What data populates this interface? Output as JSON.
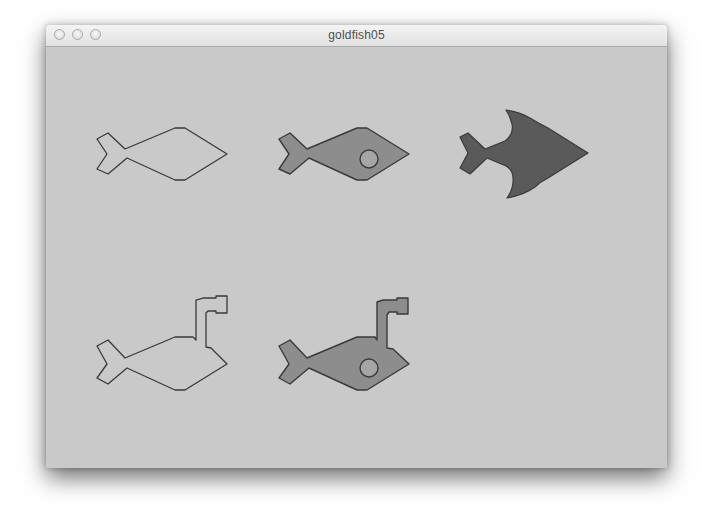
{
  "window": {
    "title": "goldfish05",
    "buttons": [
      "close",
      "minimize",
      "zoom"
    ]
  },
  "colors": {
    "background": "#c9c9c9",
    "outline": "#3a3a3a",
    "fish_fill_medium": "#8d8d8d",
    "shark_fill": "#5a5a5a",
    "eye_fill": "#a6a6a6"
  },
  "sprites": [
    {
      "id": "fish-outline",
      "row": 1,
      "col": 1,
      "style": "outline"
    },
    {
      "id": "fish-filled-eye",
      "row": 1,
      "col": 2,
      "style": "filled"
    },
    {
      "id": "shark",
      "row": 1,
      "col": 3,
      "style": "dark-filled"
    },
    {
      "id": "submarine-fish-outline",
      "row": 2,
      "col": 1,
      "style": "outline"
    },
    {
      "id": "submarine-fish-filled-eye",
      "row": 2,
      "col": 2,
      "style": "filled"
    }
  ]
}
